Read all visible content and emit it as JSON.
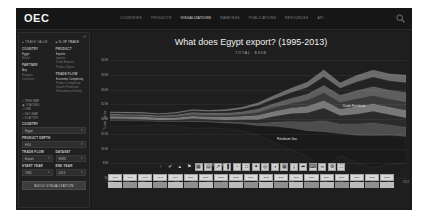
{
  "nav": {
    "logo": "OEC",
    "links": [
      {
        "label": "COUNTRIES",
        "active": false
      },
      {
        "label": "PRODUCTS",
        "active": false
      },
      {
        "label": "VISUALIZATIONS",
        "active": true
      },
      {
        "label": "RANKINGS",
        "active": false
      },
      {
        "label": "PUBLICATIONS",
        "active": false
      },
      {
        "label": "RESOURCES",
        "active": false
      },
      {
        "label": "API",
        "active": false
      }
    ],
    "search_icon": "search-icon"
  },
  "sidebar": {
    "close_icon": "close-icon",
    "tabs": [
      {
        "label": "TRADE VALUE",
        "active": false
      },
      {
        "label": "% OF TRADE",
        "active": true
      }
    ],
    "groups": [
      {
        "title": "COUNTRY",
        "options": [
          "Egypt",
          "World"
        ]
      },
      {
        "title": "PRODUCT",
        "options": [
          "Exports",
          "Imports",
          "Trade Balance",
          "Product Space"
        ]
      },
      {
        "title": "PARTNER",
        "options": [
          "Any",
          "Regions",
          "Countries"
        ]
      },
      {
        "title": "TRADE FLOW",
        "options": [
          "Economic Complexity",
          "Product Complexity",
          "Growth Prediction",
          "Relatedness Density"
        ]
      }
    ],
    "radios": [
      {
        "label": "TREE MAP",
        "selected": false
      },
      {
        "label": "STACKED",
        "selected": true
      },
      {
        "label": "LINE",
        "selected": false
      },
      {
        "label": "GEO MAP",
        "selected": false
      },
      {
        "label": "SCATTER",
        "selected": false
      }
    ],
    "fields": [
      {
        "label": "COUNTRY",
        "value": "Egypt"
      },
      {
        "label": "PRODUCT DEPTH",
        "value": "HS4"
      }
    ],
    "field_pairs": [
      [
        {
          "label": "TRADE FLOW",
          "value": "Export"
        },
        {
          "label": "DATASET",
          "value": "HS92"
        }
      ],
      [
        {
          "label": "START YEAR",
          "value": "1995"
        },
        {
          "label": "END YEAR",
          "value": "2013"
        }
      ]
    ],
    "build_button": "BUILD VISUALIZATION"
  },
  "viz": {
    "title": "What does Egypt export? (1995-2013)",
    "subtitle": "TOTAL: $30B"
  },
  "toolbar": {
    "buttons": [
      {
        "icon": "cursor-icon",
        "name": "cursor-tool",
        "style": "plain"
      },
      {
        "icon": "pencil-icon",
        "name": "pencil-tool",
        "style": "plain"
      },
      {
        "icon": "eraser-icon",
        "name": "eraser-tool",
        "style": "plain"
      },
      {
        "icon": "flag-icon",
        "name": "flag-tool",
        "style": "plain"
      },
      {
        "icon": "treemap-icon",
        "name": "viz-treemap",
        "style": "light"
      },
      {
        "icon": "stacked-icon",
        "name": "viz-stacked",
        "style": "light"
      },
      {
        "icon": "line-icon",
        "name": "viz-line",
        "style": "light"
      },
      {
        "icon": "bar-icon",
        "name": "viz-bar",
        "style": "light"
      },
      {
        "icon": "geomap-icon",
        "name": "viz-geomap",
        "style": "light"
      },
      {
        "icon": "scatter-icon",
        "name": "viz-scatter",
        "style": "light"
      },
      {
        "icon": "network-icon",
        "name": "viz-network",
        "style": "light"
      },
      {
        "icon": "rings-icon",
        "name": "viz-rings",
        "style": "light"
      },
      {
        "icon": "pie-icon",
        "name": "viz-pie",
        "style": "light"
      },
      {
        "icon": "table-icon",
        "name": "viz-table",
        "style": "light"
      },
      {
        "icon": "download-icon",
        "name": "download-button",
        "style": "light"
      },
      {
        "icon": "share-icon",
        "name": "share-button",
        "style": "light"
      },
      {
        "icon": "embed-icon",
        "name": "embed-button",
        "style": "light"
      },
      {
        "icon": "link-icon",
        "name": "link-button",
        "style": "light"
      },
      {
        "icon": "settings-icon",
        "name": "settings-button",
        "style": "light"
      },
      {
        "icon": "fullscreen-icon",
        "name": "fullscreen-button",
        "style": "light"
      }
    ],
    "timeline_label": "Year"
  },
  "chart_data": {
    "type": "area",
    "title": "What does Egypt export? (1995-2013)",
    "subtitle": "TOTAL: $30B",
    "xlabel": "",
    "ylabel": "Trade Value",
    "x": [
      1995,
      1996,
      1997,
      1998,
      1999,
      2000,
      2001,
      2002,
      2003,
      2004,
      2005,
      2006,
      2007,
      2008,
      2009,
      2010,
      2011,
      2012,
      2013
    ],
    "ytick_labels": [
      "$0",
      "$5B",
      "$10B",
      "$15B",
      "$20B",
      "$25B",
      "$30B",
      "$35B",
      "$40B"
    ],
    "ylim": [
      0,
      40
    ],
    "grid": true,
    "legend": "inline-labels",
    "series": [
      {
        "name": "Crude Petroleum",
        "color": "#1a1a1a",
        "values": [
          1.9,
          1.7,
          1.6,
          1.1,
          1.4,
          2.4,
          2.0,
          1.9,
          2.4,
          3.3,
          5.6,
          7.4,
          8.6,
          12.4,
          7.4,
          9.3,
          11.0,
          9.8,
          9.0
        ]
      },
      {
        "name": "Petroleum Gas",
        "color": "#4d4d4d",
        "values": [
          0.1,
          0.1,
          0.1,
          0.1,
          0.1,
          0.2,
          0.2,
          0.3,
          0.5,
          0.8,
          1.4,
          2.3,
          3.0,
          3.8,
          3.3,
          3.9,
          4.3,
          3.6,
          3.1
        ]
      },
      {
        "name": "Refined Petroleum",
        "color": "#2b2b2b",
        "values": [
          0.6,
          0.6,
          0.5,
          0.4,
          0.5,
          0.8,
          0.7,
          0.7,
          0.9,
          1.3,
          2.0,
          2.6,
          3.1,
          4.2,
          2.8,
          3.3,
          3.9,
          3.5,
          3.2
        ]
      },
      {
        "name": "Other Textiles",
        "color": "#787878",
        "values": [
          0.8,
          0.8,
          0.8,
          0.7,
          0.7,
          0.9,
          0.9,
          1.0,
          1.1,
          1.4,
          1.7,
          1.9,
          2.2,
          2.6,
          2.2,
          2.5,
          2.6,
          2.5,
          2.6
        ]
      },
      {
        "name": "Machinery",
        "color": "#3a3a3a",
        "values": [
          0.3,
          0.3,
          0.3,
          0.3,
          0.4,
          0.5,
          0.5,
          0.6,
          0.7,
          1.0,
          1.3,
          1.6,
          2.1,
          2.6,
          2.3,
          2.7,
          2.8,
          2.7,
          2.8
        ]
      },
      {
        "name": "Agriculture",
        "color": "#5e5e5e",
        "values": [
          0.5,
          0.5,
          0.5,
          0.5,
          0.6,
          0.7,
          0.7,
          0.8,
          0.9,
          1.2,
          1.4,
          1.7,
          2.0,
          2.5,
          2.4,
          2.8,
          3.0,
          3.1,
          3.3
        ]
      },
      {
        "name": "Chemicals",
        "color": "#232323",
        "values": [
          0.4,
          0.4,
          0.4,
          0.4,
          0.5,
          0.6,
          0.6,
          0.7,
          0.9,
          1.2,
          1.5,
          1.9,
          2.3,
          3.0,
          2.4,
          2.9,
          3.2,
          3.1,
          3.3
        ]
      },
      {
        "name": "Metals",
        "color": "#6b6b6b",
        "values": [
          0.3,
          0.3,
          0.3,
          0.3,
          0.3,
          0.4,
          0.4,
          0.5,
          0.6,
          0.9,
          1.2,
          1.5,
          1.8,
          2.3,
          1.8,
          2.2,
          2.4,
          2.4,
          2.5
        ]
      }
    ],
    "annotations": [
      {
        "text": "Crude Petroleum",
        "x": 2010,
        "y": 24
      },
      {
        "text": "Petroleum Gas",
        "x": 2006,
        "y": 13
      },
      {
        "text": "Other Textiles",
        "x": 2002,
        "y": 4
      }
    ]
  }
}
